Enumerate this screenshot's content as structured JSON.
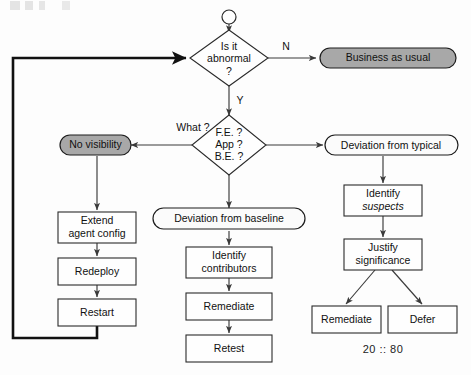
{
  "diagram": {
    "type": "flowchart",
    "colors": {
      "gray_fill": "#a8a8a8",
      "white_fill": "#fbfbfb",
      "stroke": "#2b2b2b",
      "thick_stroke": "#111111"
    },
    "nodes": {
      "start": {
        "shape": "circle",
        "label": ""
      },
      "decision_abnormal": {
        "shape": "diamond",
        "line1": "Is it",
        "line2": "abnormal",
        "line3": "?"
      },
      "business_as_usual": {
        "shape": "pill",
        "fill": "gray",
        "label": "Business as usual"
      },
      "decision_what": {
        "shape": "diamond",
        "line1": "F.E. ?",
        "line2": "App ?",
        "line3": "B.E. ?"
      },
      "no_visibility": {
        "shape": "pill",
        "fill": "gray",
        "label": "No visibility"
      },
      "deviation_typical": {
        "shape": "pill",
        "fill": "white",
        "label_plain": "Deviation from ",
        "label_italic": "typical"
      },
      "deviation_baseline": {
        "shape": "pill",
        "fill": "white",
        "label_plain": "Deviation from ",
        "label_italic": "baseline"
      },
      "extend_agent_config": {
        "shape": "box",
        "line1": "Extend",
        "line2": "agent config"
      },
      "redeploy": {
        "shape": "box",
        "line1": "Redeploy"
      },
      "restart": {
        "shape": "box",
        "line1": "Restart"
      },
      "identify_contributors": {
        "shape": "box",
        "line1": "Identify",
        "line2": "contributors"
      },
      "remediate_center": {
        "shape": "box",
        "line1": "Remediate"
      },
      "retest": {
        "shape": "box",
        "line1": "Retest"
      },
      "identify_suspects": {
        "shape": "box",
        "line1": "Identify",
        "line2_italic": "suspects"
      },
      "justify_significance": {
        "shape": "box",
        "line1": "Justify",
        "line2": "significance"
      },
      "remediate_right": {
        "shape": "box",
        "line1": "Remediate"
      },
      "defer": {
        "shape": "box",
        "line1": "Defer"
      }
    },
    "edge_labels": {
      "no": "N",
      "yes": "Y",
      "what": "What ?"
    },
    "annotations": {
      "ratio": "20 :: 80"
    }
  }
}
